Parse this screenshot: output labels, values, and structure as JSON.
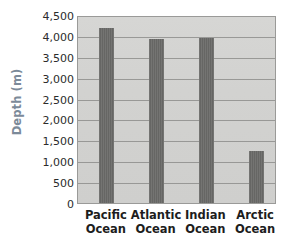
{
  "chart_data": {
    "type": "bar",
    "title": "",
    "xlabel": "",
    "ylabel": "Depth (m)",
    "categories": [
      "Pacific Ocean",
      "Atlantic Ocean",
      "Indian Ocean",
      "Arctic Ocean"
    ],
    "category_lines": [
      [
        "Pacific",
        "Ocean"
      ],
      [
        "Atlantic",
        "Ocean"
      ],
      [
        "Indian",
        "Ocean"
      ],
      [
        "Arctic",
        "Ocean"
      ]
    ],
    "values": [
      4200,
      3930,
      3960,
      1250
    ],
    "ylim": [
      0,
      4500
    ],
    "ytick_step": 500,
    "ytick_labels": [
      "4,500",
      "4,000",
      "3,500",
      "3,000",
      "2,500",
      "2,000",
      "1,500",
      "1,000",
      "500",
      "0"
    ],
    "ytick_values": [
      4500,
      4000,
      3500,
      3000,
      2500,
      2000,
      1500,
      1000,
      500,
      0
    ],
    "grid": true,
    "legend": false,
    "legend_position": "none",
    "colors": {
      "bar_dark": "#4e4e4c",
      "bar_mid": "#7e7e7c",
      "plot_background": "#d3d3d1",
      "gridline": "#8e8e8c",
      "plot_border": "#9a9a98",
      "axis_title": "#7c8a99",
      "tick_text": "#2b2b2b",
      "category_text": "#1d1d1d",
      "page_background": "#ffffff"
    }
  }
}
